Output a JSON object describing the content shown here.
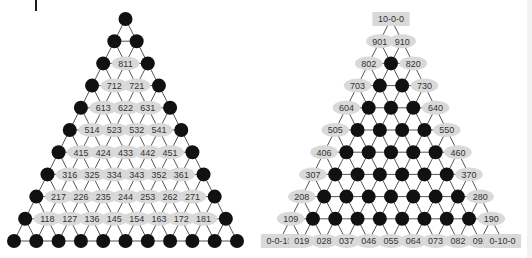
{
  "figure": {
    "levels": 10,
    "colors": {
      "line": "#555555",
      "node_fill": "#111111",
      "label_fill": "#d9d9d9",
      "label_text": "#333333"
    }
  },
  "left_triangle": {
    "name": "interior-labeled-triangle",
    "labeled_nodes": "interior",
    "rows": [
      [],
      [],
      [
        "811"
      ],
      [
        "712",
        "721"
      ],
      [
        "613",
        "622",
        "631"
      ],
      [
        "514",
        "523",
        "532",
        "541"
      ],
      [
        "415",
        "424",
        "433",
        "442",
        "451"
      ],
      [
        "316",
        "325",
        "334",
        "343",
        "352",
        "361"
      ],
      [
        "217",
        "226",
        "235",
        "244",
        "253",
        "262",
        "271"
      ],
      [
        "118",
        "127",
        "136",
        "145",
        "154",
        "163",
        "172",
        "181"
      ],
      []
    ]
  },
  "right_triangle": {
    "name": "boundary-labeled-triangle",
    "labeled_nodes": "boundary",
    "corners": [
      "10-0-0",
      "0-0-10",
      "0-10-0"
    ],
    "left_edge": [
      "901",
      "802",
      "703",
      "604",
      "505",
      "406",
      "307",
      "208",
      "109"
    ],
    "right_edge": [
      "910",
      "820",
      "730",
      "640",
      "550",
      "460",
      "370",
      "280",
      "190"
    ],
    "bottom_edge": [
      "019",
      "028",
      "037",
      "046",
      "055",
      "064",
      "073",
      "082",
      "091"
    ]
  }
}
